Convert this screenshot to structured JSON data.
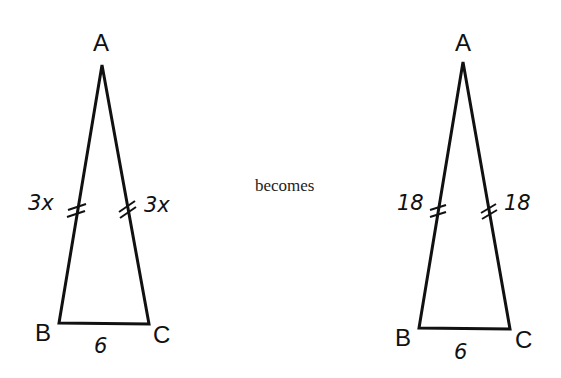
{
  "left_triangle": {
    "vertices": {
      "A": "A",
      "B": "B",
      "C": "C"
    },
    "side_AB": "3x",
    "side_AC": "3x",
    "side_BC": "6"
  },
  "connector": "becomes",
  "right_triangle": {
    "vertices": {
      "A": "A",
      "B": "B",
      "C": "C"
    },
    "side_AB": "18",
    "side_AC": "18",
    "side_BC": "6"
  }
}
